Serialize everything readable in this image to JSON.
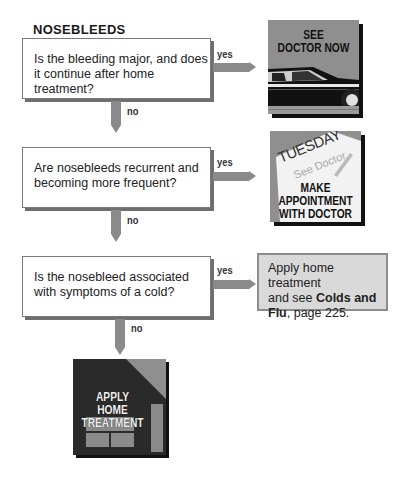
{
  "title": "NOSEBLEEDS",
  "questions": [
    {
      "text_line1": "Is the bleeding major, and does",
      "text_line2": "it continue after home treatment?",
      "yes_label": "yes",
      "no_label": "no",
      "outcome": {
        "type": "icon",
        "icon": "car-icon",
        "line1": "SEE",
        "line2": "DOCTOR NOW"
      }
    },
    {
      "text_line1": "Are nosebleeds recurrent and",
      "text_line2": "becoming more frequent?",
      "yes_label": "yes",
      "no_label": "no",
      "outcome": {
        "type": "icon",
        "icon": "calendar-note-icon",
        "note_day": "TUESDAY",
        "note_text": "See Doctor",
        "line1": "MAKE",
        "line2": "APPOINTMENT",
        "line3": "WITH DOCTOR"
      }
    },
    {
      "text_line1": "Is the nosebleed associated",
      "text_line2": "with symptoms of a cold?",
      "yes_label": "yes",
      "no_label": "no",
      "outcome": {
        "type": "text",
        "line1": "Apply home treatment",
        "line2_plain": "and see ",
        "line2_bold": "Colds and",
        "line3_bold": "Flu",
        "line3_plain": ", page 225."
      }
    }
  ],
  "final": {
    "icon": "house-icon",
    "line1": "APPLY",
    "line2": "HOME",
    "line3": "TREATMENT"
  },
  "colors": {
    "arrow": "#8a8a8a",
    "tile_gray": "#8f8f8f",
    "tile_dark": "#2a2a2a",
    "cold_box": "#d9d9d9"
  }
}
